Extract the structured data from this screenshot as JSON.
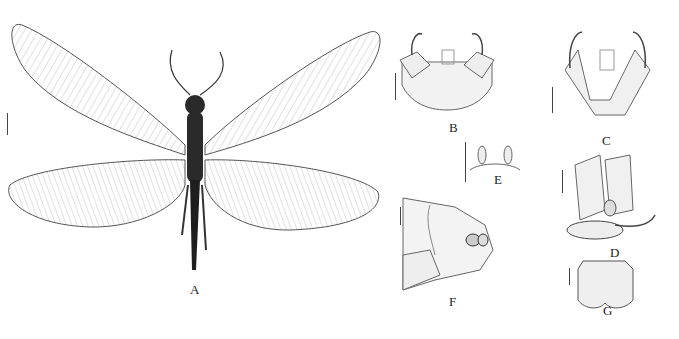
{
  "figure": {
    "panels": [
      {
        "id": "A",
        "label": "A",
        "subject": "whole insect, dorsal view, wings spread"
      },
      {
        "id": "B",
        "label": "B",
        "subject": "genitalia, dorsal view"
      },
      {
        "id": "C",
        "label": "C",
        "subject": "genitalia, ventral view"
      },
      {
        "id": "D",
        "label": "D",
        "subject": "genitalia, lateral view"
      },
      {
        "id": "E",
        "label": "E",
        "subject": "genital structure, small"
      },
      {
        "id": "F",
        "label": "F",
        "subject": "abdominal tip, lateral view"
      },
      {
        "id": "G",
        "label": "G",
        "subject": "plate, ventral view"
      }
    ],
    "colors": {
      "background": "#ffffff",
      "ink": "#222222",
      "wing": "#bdbdbd",
      "body": "#2a2a2a"
    }
  }
}
